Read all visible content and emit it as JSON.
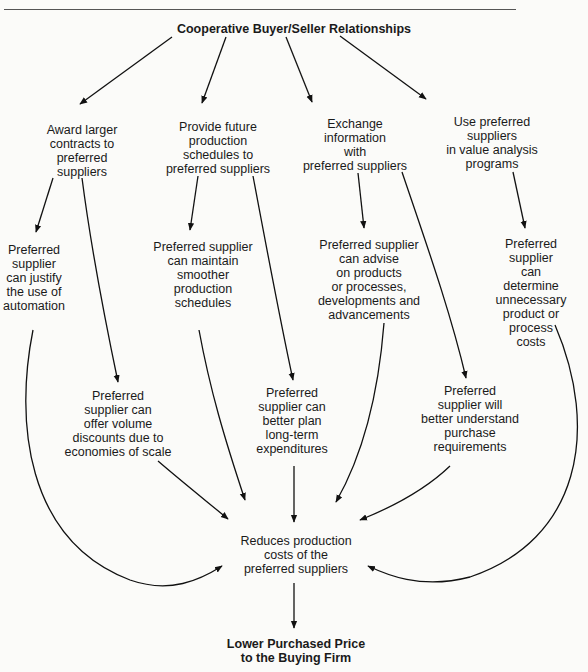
{
  "diagram": {
    "root": "Cooperative Buyer/Seller Relationships",
    "actions": [
      "Award larger\ncontracts to\npreferred\nsuppliers",
      "Provide future\nproduction\nschedules to\npreferred suppliers",
      "Exchange\ninformation\nwith\npreferred suppliers",
      "Use preferred\nsuppliers\nin value analysis\nprograms"
    ],
    "benefits_upper": [
      "Preferred\nsupplier\ncan justify\nthe use of\nautomation",
      "Preferred supplier\ncan maintain\nsmoother\nproduction\nschedules",
      "Preferred supplier\ncan advise\non products\nor processes,\ndevelopments and\nadvancements",
      "Preferred supplier\ncan determine\nunnecessary\nproduct or\nprocess costs"
    ],
    "benefits_lower": [
      "Preferred\nsupplier can\noffer volume\ndiscounts due to\neconomies of scale",
      "Preferred\nsupplier can\nbetter plan\nlong-term\nexpenditures",
      "Preferred\nsupplier will\nbetter understand\npurchase\nrequirements"
    ],
    "convergence": "Reduces production\ncosts of the\npreferred suppliers",
    "outcome": "Lower Purchased Price\nto the Buying Firm"
  },
  "colors": {
    "line": "#111111",
    "background": "#fbfbf9"
  }
}
